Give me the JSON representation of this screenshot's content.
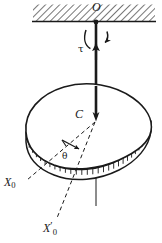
{
  "figure": {
    "kind": "mechanics-free-body-diagram",
    "background_color": "#ffffff",
    "ink_color": "#1a1a1a",
    "labels": {
      "support_point": "O",
      "torque": "τ",
      "center_of_mass": "C",
      "angle": "θ",
      "reference_axis": "X",
      "reference_axis_subscript": "0",
      "rotated_axis": "X",
      "rotated_axis_prime": "′",
      "rotated_axis_subscript": "0"
    },
    "elements": {
      "ceiling_hatched_support": "hatched-ceiling",
      "torsion_rod": "vertical-rod",
      "torque_arc_arrow": "curved-torque-arrow",
      "rod_force_arrow": "upward-arrow-on-rod",
      "body_outline": "irregular-blob-top-face",
      "body_rim": "hatched-edge-thickness",
      "axis_extension": "dashed-vertical-axis-below-body",
      "angle_arrow": "theta-direction-arrow",
      "dashed_axis_x0": "dashed-line-to-X0",
      "dashed_axis_x0_prime": "dashed-line-to-X0-prime"
    }
  }
}
